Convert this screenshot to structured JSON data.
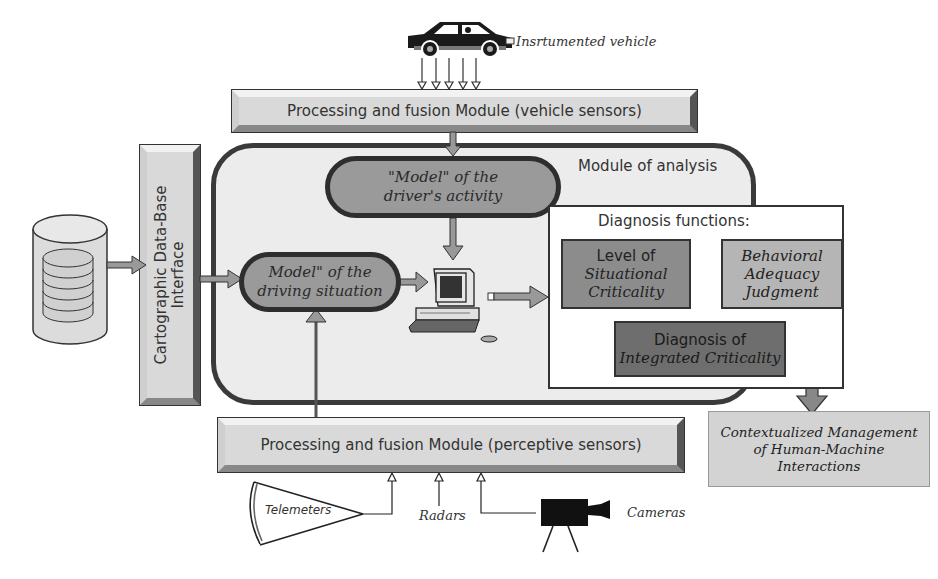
{
  "vehicle": {
    "label": "Insrtumented vehicle",
    "icon": "car-icon",
    "sensor_arrows": 5
  },
  "modules": {
    "vehicle_sensors": "Processing and fusion Module (vehicle sensors)",
    "perceptive_sensors": "Processing and fusion Module (perceptive sensors)",
    "cartographic_line1": "Cartographic Data-Base",
    "cartographic_line2": "Interface"
  },
  "analysis": {
    "title": "Module of analysis",
    "driver_model": {
      "line1": "\"Model\" of the",
      "line2": "driver's activity"
    },
    "situation_model": {
      "line1": "Model\" of the",
      "line2": "driving situation"
    },
    "computer_icon": "computer-icon"
  },
  "diagnosis": {
    "title": "Diagnosis functions:",
    "situational": {
      "line1": "Level of",
      "line2": "Situational",
      "line3": "Criticality"
    },
    "behavioral": {
      "line1": "Behavioral",
      "line2": "Adequacy",
      "line3": "Judgment"
    },
    "integrated": {
      "line1": "Diagnosis of",
      "line2": "Integrated Criticality"
    }
  },
  "output": {
    "line1": "Contextualized Management",
    "line2": "of Human-Machine",
    "line3": "Interactions"
  },
  "sensors": {
    "telemeters": "Telemeters",
    "radars": "Radars",
    "cameras": "Cameras"
  },
  "database_icon": "database-icon",
  "colors": {
    "module_fill": "#d9d9d9",
    "pill_fill": "#9a9a9a",
    "situational_fill": "#8c8c8c",
    "behavioral_fill": "#b5b5b5",
    "integrated_fill": "#6e6e6e",
    "output_fill": "#d3d3d3",
    "stroke": "#333333"
  }
}
